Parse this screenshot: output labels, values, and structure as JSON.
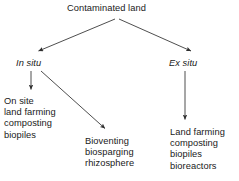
{
  "diagram": {
    "type": "tree-flowchart",
    "background_color": "#ffffff",
    "text_color": "#1a1a1a",
    "edge_color": "#3a3a3a",
    "nodes": {
      "root": {
        "label": "Contaminated land",
        "style": "normal"
      },
      "in_situ": {
        "label": "In situ",
        "style": "italic"
      },
      "ex_situ": {
        "label": "Ex situ",
        "style": "italic"
      },
      "on_site": {
        "label": "On site\nland farming\ncomposting\nbiopiles",
        "style": "normal",
        "items": [
          "On site",
          "land farming",
          "composting",
          "biopiles"
        ]
      },
      "bioventing": {
        "label": "Bioventing\nbiosparging\nrhizosphere",
        "style": "normal",
        "items": [
          "Bioventing",
          "biosparging",
          "rhizosphere"
        ]
      },
      "land_farming": {
        "label": "Land farming\ncomposting\nbiopiles\nbioreactors",
        "style": "normal",
        "items": [
          "Land farming",
          "composting",
          "biopiles",
          "bioreactors"
        ]
      }
    },
    "edges": [
      {
        "from": "root",
        "to": "in_situ",
        "kind": "arrow-diagonal-left"
      },
      {
        "from": "root",
        "to": "ex_situ",
        "kind": "arrow-diagonal-right"
      },
      {
        "from": "in_situ",
        "to": "on_site",
        "kind": "arrow-vertical"
      },
      {
        "from": "in_situ",
        "to": "bioventing",
        "kind": "arrow-diagonal-right"
      },
      {
        "from": "ex_situ",
        "to": "land_farming",
        "kind": "arrow-vertical"
      }
    ]
  }
}
